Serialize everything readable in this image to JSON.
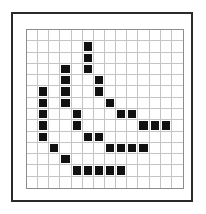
{
  "figure": {
    "type": "pixel-grid",
    "rows": 14,
    "cols": 14,
    "filled_color": "#111111",
    "empty_color": "#ffffff",
    "grid_line_color": "#c4c4c4",
    "frame_color": "#2a2a2a",
    "filled_cells": [
      [
        1,
        5
      ],
      [
        2,
        5
      ],
      [
        3,
        3
      ],
      [
        3,
        5
      ],
      [
        4,
        3
      ],
      [
        4,
        6
      ],
      [
        5,
        1
      ],
      [
        5,
        3
      ],
      [
        5,
        6
      ],
      [
        6,
        1
      ],
      [
        6,
        3
      ],
      [
        6,
        7
      ],
      [
        7,
        1
      ],
      [
        7,
        4
      ],
      [
        7,
        8
      ],
      [
        7,
        9
      ],
      [
        8,
        1
      ],
      [
        8,
        4
      ],
      [
        8,
        10
      ],
      [
        8,
        11
      ],
      [
        8,
        12
      ],
      [
        9,
        1
      ],
      [
        9,
        5
      ],
      [
        9,
        6
      ],
      [
        10,
        2
      ],
      [
        10,
        7
      ],
      [
        10,
        8
      ],
      [
        10,
        9
      ],
      [
        10,
        10
      ],
      [
        11,
        3
      ],
      [
        12,
        4
      ],
      [
        12,
        5
      ],
      [
        12,
        6
      ],
      [
        12,
        7
      ],
      [
        12,
        8
      ]
    ]
  }
}
